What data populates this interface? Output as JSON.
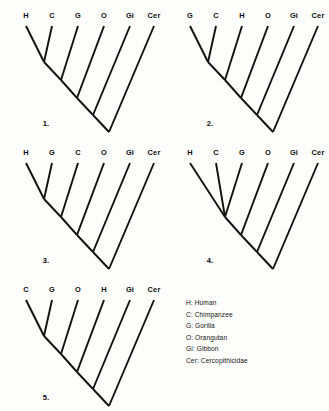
{
  "figure": {
    "background_color": "#fdfdfb",
    "line_color": "#111111",
    "text_color": "#0d0d0d"
  },
  "trees": [
    {
      "number": "1.",
      "tips": [
        "H",
        "C",
        "G",
        "O",
        "Gi",
        "Cer"
      ],
      "topology": "ladder",
      "sister_pair": [
        "H",
        "C"
      ],
      "polytomy": false,
      "origin_x": 4,
      "origin_y": 4,
      "width": 160,
      "height": 136,
      "number_x": 42,
      "number_y": 122
    },
    {
      "number": "2.",
      "tips": [
        "G",
        "C",
        "H",
        "O",
        "Gi",
        "Cer"
      ],
      "topology": "ladder",
      "sister_pair": [
        "G",
        "C"
      ],
      "polytomy": false,
      "origin_x": 168,
      "origin_y": 4,
      "width": 160,
      "height": 136,
      "number_x": 42,
      "number_y": 122
    },
    {
      "number": "3.",
      "tips": [
        "H",
        "G",
        "C",
        "O",
        "Gi",
        "Cer"
      ],
      "topology": "ladder",
      "sister_pair": [
        "H",
        "G"
      ],
      "polytomy": false,
      "origin_x": 4,
      "origin_y": 141,
      "width": 160,
      "height": 136,
      "number_x": 42,
      "number_y": 122
    },
    {
      "number": "4.",
      "tips": [
        "H",
        "C",
        "G",
        "O",
        "Gi",
        "Cer"
      ],
      "topology": "ladder",
      "sister_pair": [
        "H",
        "C",
        "G"
      ],
      "polytomy": true,
      "origin_x": 168,
      "origin_y": 141,
      "width": 160,
      "height": 136,
      "number_x": 42,
      "number_y": 122
    },
    {
      "number": "5.",
      "tips": [
        "C",
        "G",
        "O",
        "H",
        "Gi",
        "Cer"
      ],
      "topology": "ladder",
      "sister_pair": [
        "C",
        "G"
      ],
      "polytomy": false,
      "origin_x": 4,
      "origin_y": 278,
      "width": 160,
      "height": 136,
      "number_x": 42,
      "number_y": 122
    }
  ],
  "legend": {
    "entries": [
      "H: Human",
      "C: Chimpanzee",
      "G: Gorilla",
      "O: Orangutan",
      "Gi: Gibbon",
      "Cer: Cercopithicidae"
    ]
  }
}
